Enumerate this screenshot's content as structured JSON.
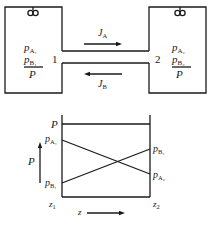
{
  "top": {
    "left_bulb": {
      "number": "1",
      "labels": [
        {
          "main": "p",
          "sub": "A₁"
        },
        {
          "main": "p",
          "sub": "B₁"
        }
      ],
      "total": "P"
    },
    "right_bulb": {
      "number": "2",
      "labels": [
        {
          "main": "p",
          "sub": "A₂"
        },
        {
          "main": "p",
          "sub": "B₂"
        }
      ],
      "total": "P"
    },
    "flux_A": {
      "main": "J",
      "sub": "A",
      "direction": "right"
    },
    "flux_B": {
      "main": "J",
      "sub": "B",
      "direction": "left"
    }
  },
  "bottom": {
    "P_line_label": "P",
    "left_labels": [
      {
        "main": "p",
        "sub": "A₁"
      },
      {
        "main": "p",
        "sub": "B₁"
      }
    ],
    "right_labels": [
      {
        "main": "p",
        "sub": "B₂"
      },
      {
        "main": "p",
        "sub": "A₂"
      }
    ],
    "y_axis_label": "P",
    "x_start": {
      "main": "z",
      "sub": "1"
    },
    "x_end": {
      "main": "z",
      "sub": "2"
    },
    "x_axis_label": "z"
  }
}
